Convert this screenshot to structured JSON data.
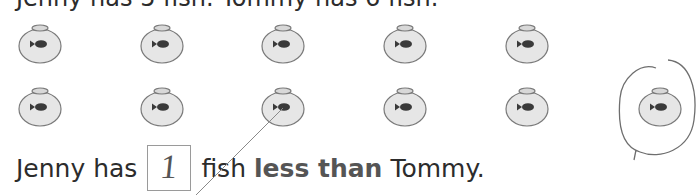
{
  "worksheet": {
    "title_cut": "Jenny has 5 fish. Tommy has 6 fish.",
    "rows": [
      {
        "name": "jenny-row",
        "bowls": 5
      },
      {
        "name": "tommy-row",
        "bowls": 6
      }
    ],
    "sentence": {
      "prefix": "Jenny has",
      "answer": "1",
      "middle": "fish",
      "bold": "less than",
      "suffix": "Tommy."
    },
    "icons": {
      "bowl": "fishbowl-icon",
      "fish": "fish-icon"
    },
    "colors": {
      "bowl_fill": "#e6e6e6",
      "bowl_stroke": "#7a7a7a",
      "fish": "#3a3a3a",
      "pencil": "#6e6e6e"
    }
  }
}
